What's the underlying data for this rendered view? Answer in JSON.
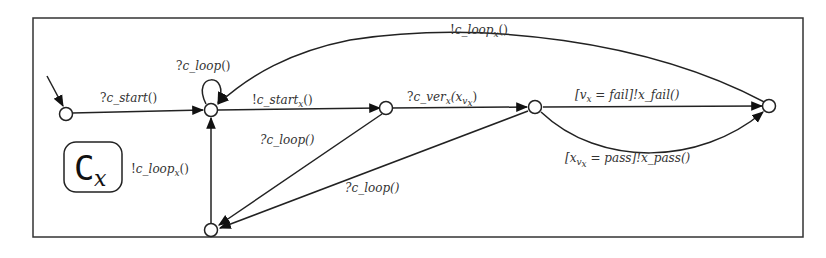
{
  "diagram": {
    "type": "state-machine",
    "component_badge": {
      "letter": "C",
      "subscript": "x"
    },
    "states": [
      {
        "id": "s0",
        "role": "initial"
      },
      {
        "id": "s1"
      },
      {
        "id": "s2"
      },
      {
        "id": "s3"
      },
      {
        "id": "s4"
      },
      {
        "id": "s5"
      }
    ],
    "transitions": [
      {
        "from": "init",
        "to": "s0",
        "label": ""
      },
      {
        "from": "s0",
        "to": "s1",
        "label": "?c_start()"
      },
      {
        "from": "s1",
        "to": "s1",
        "label": "?c_loop()"
      },
      {
        "from": "s1",
        "to": "s2",
        "label": "!c_start_x()"
      },
      {
        "from": "s2",
        "to": "s3",
        "label": "?c_ver_x(x_v_x)"
      },
      {
        "from": "s3",
        "to": "s4",
        "label": "[v_x = fail]!x_fail()"
      },
      {
        "from": "s3",
        "to": "s4",
        "label": "[x_v_x = pass]!x_pass()"
      },
      {
        "from": "s4",
        "to": "s1",
        "label": "!c_loop_x()"
      },
      {
        "from": "s2",
        "to": "s5",
        "label": "?c_loop()"
      },
      {
        "from": "s3",
        "to": "s5",
        "label": "?c_loop()"
      },
      {
        "from": "s5",
        "to": "s1",
        "label": "!c_loop_x()"
      }
    ],
    "labels": {
      "c_start": {
        "q": "?",
        "base": "c_start",
        "sub": "",
        "tail": "()"
      },
      "self_loop": {
        "q": "?",
        "base": "c_loop",
        "sub": "",
        "tail": "()"
      },
      "c_start_x": {
        "q": "!",
        "base": "c_start",
        "sub": "x",
        "tail": "()"
      },
      "c_ver_x": {
        "q": "?",
        "base": "c_ver",
        "sub": "x",
        "tail": "(x",
        "sub2": "v",
        "sub3": "x",
        "close": ")"
      },
      "fail": {
        "text": "[v",
        "sub": "x",
        "rest": " = fail]!x_fail()"
      },
      "pass": {
        "text": "[x",
        "sub": "v",
        "sub2": "x",
        "rest": " = pass]!x_pass()"
      },
      "top_loop": {
        "q": "!",
        "base": "c_loop",
        "sub": "x",
        "tail": "()"
      },
      "loop_a": {
        "text": "?c_loop()"
      },
      "loop_b": {
        "text": "?c_loop()"
      },
      "left_loop": {
        "q": "!",
        "base": "c_loop",
        "sub": "x",
        "tail": "()"
      }
    }
  }
}
